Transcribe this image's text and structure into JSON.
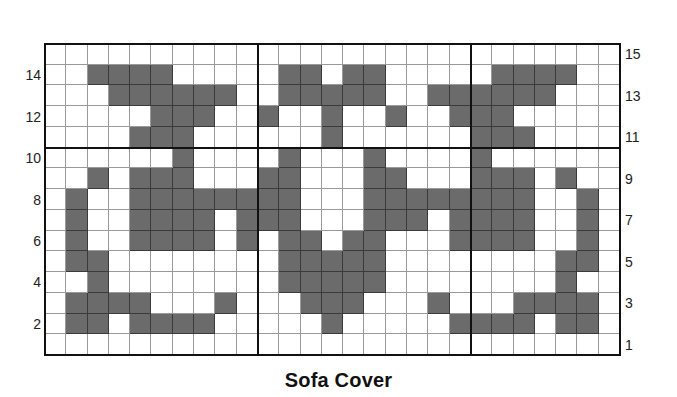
{
  "title": "Sofa Cover",
  "grid": {
    "columns": 27,
    "rows": 15,
    "fill_color": "#6b6b6b",
    "thick_divider_after_columns": [
      10,
      20
    ],
    "thick_divider_below_row": 11,
    "filled_cells_by_row": {
      "15": [],
      "14": [
        3,
        4,
        5,
        6,
        12,
        13,
        15,
        16,
        22,
        23,
        24,
        25
      ],
      "13": [
        4,
        5,
        6,
        7,
        8,
        9,
        12,
        13,
        14,
        15,
        16,
        19,
        20,
        21,
        22,
        23,
        24
      ],
      "12": [
        6,
        7,
        8,
        11,
        14,
        17,
        20,
        21,
        22
      ],
      "11": [
        5,
        6,
        7,
        14,
        21,
        22,
        23
      ],
      "10": [
        7,
        12,
        16,
        21
      ],
      "9": [
        3,
        5,
        6,
        7,
        11,
        12,
        16,
        17,
        21,
        22,
        23,
        25
      ],
      "8": [
        2,
        5,
        6,
        7,
        8,
        9,
        10,
        11,
        12,
        16,
        17,
        18,
        19,
        20,
        21,
        22,
        23,
        26
      ],
      "7": [
        2,
        5,
        6,
        7,
        8,
        10,
        11,
        12,
        16,
        17,
        18,
        20,
        21,
        22,
        23,
        26
      ],
      "6": [
        2,
        5,
        6,
        7,
        8,
        10,
        12,
        13,
        15,
        16,
        20,
        21,
        22,
        23,
        26
      ],
      "5": [
        2,
        3,
        12,
        13,
        14,
        15,
        16,
        25,
        26
      ],
      "4": [
        3,
        12,
        13,
        14,
        15,
        16,
        25
      ],
      "3": [
        2,
        3,
        4,
        5,
        9,
        13,
        14,
        15,
        19,
        23,
        24,
        25,
        26
      ],
      "2": [
        2,
        3,
        5,
        6,
        7,
        8,
        14,
        20,
        21,
        22,
        23,
        25,
        26
      ],
      "1": []
    }
  },
  "labels": {
    "left": [
      "14",
      "12",
      "10",
      "8",
      "6",
      "4",
      "2"
    ],
    "right": [
      "15",
      "13",
      "11",
      "9",
      "7",
      "5",
      "3",
      "1"
    ]
  }
}
